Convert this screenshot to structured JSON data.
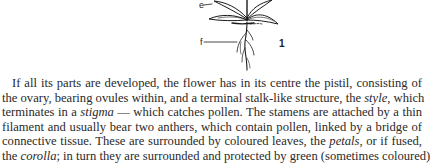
{
  "figure": {
    "labels": {
      "e": "e",
      "f": "f",
      "number": "1"
    }
  },
  "paragraph": {
    "lines": [
      {
        "segments": [
          {
            "text": "If all its parts are developed, the flower has in its centre the pistil, consisting of",
            "italic": false
          }
        ]
      },
      {
        "segments": [
          {
            "text": "the ovary, bearing ovules within, and a terminal stalk-like structure, the ",
            "italic": false
          },
          {
            "text": "style",
            "italic": true
          },
          {
            "text": ", which",
            "italic": false
          }
        ]
      },
      {
        "segments": [
          {
            "text": "terminates in a ",
            "italic": false
          },
          {
            "text": "stigma",
            "italic": true
          },
          {
            "text": " — which catches pollen. The stamens are attached by a thin",
            "italic": false
          }
        ]
      },
      {
        "segments": [
          {
            "text": "filament and usually bear two anthers, which contain pollen, linked by a bridge of",
            "italic": false
          }
        ]
      },
      {
        "segments": [
          {
            "text": "connective tissue. These are surrounded by coloured leaves, the ",
            "italic": false
          },
          {
            "text": "petals",
            "italic": true
          },
          {
            "text": ", or if fused,",
            "italic": false
          }
        ]
      },
      {
        "segments": [
          {
            "text": "the ",
            "italic": false
          },
          {
            "text": "corolla",
            "italic": true
          },
          {
            "text": "; in turn they are surrounded and protected by green (sometimes coloured)",
            "italic": false
          }
        ]
      }
    ]
  }
}
